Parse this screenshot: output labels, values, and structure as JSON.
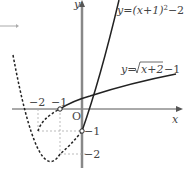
{
  "graph": {
    "axes": {
      "x_label": "x",
      "y_label": "y",
      "origin_label": "O"
    },
    "curves": [
      {
        "name": "parabola",
        "label": "y=(x+1)²−2",
        "style": "solid for x≥0, dashed otherwise"
      },
      {
        "name": "sqrt",
        "label": "y=√(x+2)−1",
        "style": "solid for x≥−1, dashed otherwise"
      }
    ],
    "tick_labels": {
      "x_neg2": "−2",
      "x_neg1": "−1",
      "y_neg1": "−1",
      "y_neg2": "−2"
    },
    "labels": {
      "parabola_text": "y=(x+1)",
      "parabola_exp": "2",
      "parabola_tail": "−2",
      "sqrt_prefix": "y=",
      "sqrt_radicand": "x+2",
      "sqrt_tail": "−1"
    }
  }
}
